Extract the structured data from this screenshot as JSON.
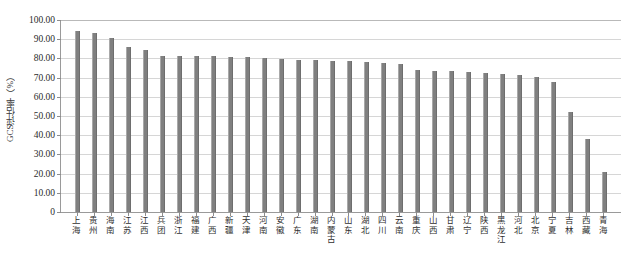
{
  "chart_data": {
    "type": "bar",
    "title": "",
    "subtitle": "",
    "xlabel": "",
    "ylabel": "GCS评估率（%）",
    "ylim": [
      0,
      100
    ],
    "grid": true,
    "legend": null,
    "legend_position": "none",
    "bar_color": "#808080",
    "gridline_color": "#d6d6d6",
    "axis_color": "#9a9a9a",
    "ytick_labels": [
      "100.00",
      "90.00",
      "80.00",
      "70.00",
      "60.00",
      "50.00",
      "40.00",
      "30.00",
      "20.00",
      "10.00",
      "0"
    ],
    "ytick_values": [
      100,
      90,
      80,
      70,
      60,
      50,
      40,
      30,
      20,
      10,
      0
    ],
    "categories": [
      "上海",
      "贵州",
      "海南",
      "江苏",
      "江西",
      "兵团",
      "浙江",
      "福建",
      "广西",
      "新疆",
      "天津",
      "河南",
      "安徽",
      "广东",
      "湖南",
      "内蒙古",
      "山东",
      "湖北",
      "四川",
      "云南",
      "重庆",
      "山西",
      "甘肃",
      "辽宁",
      "陕西",
      "黑龙江",
      "河北",
      "北京",
      "宁夏",
      "吉林",
      "西藏",
      "青海"
    ],
    "values": [
      94.5,
      93.2,
      90.8,
      86.0,
      84.5,
      81.5,
      81.3,
      81.2,
      81.0,
      80.8,
      80.6,
      80.3,
      79.5,
      79.3,
      79.0,
      78.8,
      78.5,
      78.2,
      77.5,
      77.2,
      74.0,
      73.5,
      73.2,
      72.8,
      72.5,
      72.0,
      71.5,
      70.5,
      67.5,
      52.0,
      38.0,
      21.0
    ]
  }
}
